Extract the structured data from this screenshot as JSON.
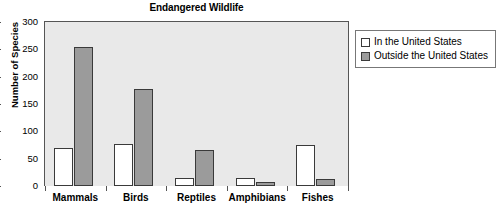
{
  "chart_data": {
    "type": "bar",
    "title": "Endangered Wildlife",
    "xlabel": "",
    "ylabel": "Number of Species",
    "categories": [
      "Mammals",
      "Birds",
      "Reptiles",
      "Amphibians",
      "Fishes"
    ],
    "series": [
      {
        "name": "In the United States",
        "color": "#ffffff",
        "values": [
          70,
          77,
          14,
          14,
          75
        ]
      },
      {
        "name": "Outside the United States",
        "color": "#9b9b9b",
        "values": [
          255,
          178,
          65,
          7,
          12
        ]
      }
    ],
    "ylim": [
      0,
      300
    ],
    "ytick_values": [
      0,
      50,
      100,
      150,
      200,
      250,
      300
    ],
    "ytick_labels": [
      "0",
      "50",
      "100",
      "150",
      "200",
      "250",
      "300"
    ],
    "grid": false,
    "legend_position": "right-top",
    "plot_background": "#e9e9e9",
    "axis_color": "#555555",
    "bar_outline_color": "#3a3a3a"
  },
  "legend": {
    "items": [
      {
        "label": "In the United States",
        "swatch": "white-square-swatch"
      },
      {
        "label": "Outside the United States",
        "swatch": "gray-square-swatch"
      }
    ]
  }
}
